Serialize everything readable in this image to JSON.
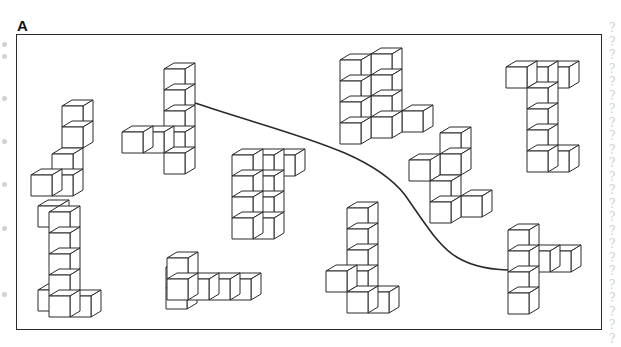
{
  "figure": {
    "panel_label": "A",
    "line_color": "#2a2a2a",
    "fill_color": "#ffffff",
    "cube_size": 21,
    "depth_dx": 10,
    "depth_dy": 6,
    "connector": {
      "from_shape": "shape-2",
      "to_shape": "shape-10",
      "path": "M195,103 C290,135 370,150 405,195 C440,245 450,268 508,270"
    },
    "shapes": [
      {
        "id": "shape-1",
        "origin": [
          31,
          112
        ],
        "cubes": [
          [
            1,
            3,
            0
          ],
          [
            1,
            2,
            0
          ],
          [
            0,
            3,
            0
          ],
          [
            1,
            1,
            1
          ],
          [
            1,
            0,
            1
          ]
        ]
      },
      {
        "id": "shape-2",
        "origin": [
          122,
          132
        ],
        "cubes": [
          [
            0,
            0,
            0
          ],
          [
            1,
            0,
            0
          ],
          [
            2,
            0,
            0
          ],
          [
            2,
            1,
            0
          ],
          [
            2,
            -1,
            0
          ],
          [
            2,
            -2,
            0
          ],
          [
            2,
            -3,
            0
          ]
        ]
      },
      {
        "id": "shape-3",
        "origin": [
          232,
          218
        ],
        "cubes": [
          [
            0,
            0,
            0
          ],
          [
            1,
            0,
            0
          ],
          [
            0,
            -1,
            0
          ],
          [
            1,
            -1,
            0
          ],
          [
            0,
            -2,
            0
          ],
          [
            1,
            -2,
            0
          ],
          [
            0,
            -3,
            0
          ],
          [
            1,
            -3,
            0
          ],
          [
            2,
            -3,
            0
          ]
        ]
      },
      {
        "id": "shape-4",
        "origin": [
          340,
          123
        ],
        "cubes": [
          [
            0,
            0,
            0
          ],
          [
            0,
            -1,
            0
          ],
          [
            0,
            -2,
            0
          ],
          [
            0,
            -3,
            0
          ],
          [
            1,
            0,
            1
          ],
          [
            1,
            -1,
            1
          ],
          [
            1,
            -2,
            1
          ],
          [
            1,
            -3,
            1
          ],
          [
            2,
            0,
            2
          ]
        ]
      },
      {
        "id": "shape-5",
        "origin": [
          409,
          160
        ],
        "cubes": [
          [
            0,
            0,
            0
          ],
          [
            1,
            0,
            1
          ],
          [
            1,
            -1,
            1
          ],
          [
            1,
            1,
            0
          ],
          [
            1,
            2,
            0
          ],
          [
            2,
            2,
            1
          ]
        ]
      },
      {
        "id": "shape-6",
        "origin": [
          506,
          67
        ],
        "cubes": [
          [
            0,
            0,
            0
          ],
          [
            1,
            0,
            0
          ],
          [
            2,
            0,
            0
          ],
          [
            1,
            1,
            0
          ],
          [
            1,
            2,
            0
          ],
          [
            1,
            3,
            0
          ],
          [
            1,
            4,
            0
          ],
          [
            2,
            4,
            0
          ]
        ]
      },
      {
        "id": "shape-7",
        "origin": [
          28,
          296
        ],
        "cubes": [
          [
            0,
            0,
            1
          ],
          [
            1,
            0,
            0
          ],
          [
            2,
            0,
            0
          ],
          [
            1,
            -1,
            0
          ],
          [
            1,
            -2,
            0
          ],
          [
            1,
            -3,
            0
          ],
          [
            0,
            -4,
            1
          ],
          [
            1,
            -4,
            0
          ]
        ]
      },
      {
        "id": "shape-8",
        "origin": [
          146,
          300
        ],
        "cubes": [
          [
            0,
            0,
            2
          ],
          [
            0,
            -1,
            2
          ],
          [
            1,
            -1,
            0
          ],
          [
            2,
            -1,
            0
          ],
          [
            3,
            -1,
            0
          ],
          [
            4,
            -1,
            0
          ],
          [
            1,
            -2,
            0
          ]
        ]
      },
      {
        "id": "shape-9",
        "origin": [
          326,
          292
        ],
        "cubes": [
          [
            0,
            -1,
            0
          ],
          [
            1,
            0,
            0
          ],
          [
            2,
            0,
            0
          ],
          [
            1,
            -1,
            0
          ],
          [
            1,
            -2,
            0
          ],
          [
            1,
            -3,
            0
          ],
          [
            1,
            -4,
            0
          ]
        ]
      },
      {
        "id": "shape-10",
        "origin": [
          508,
          293
        ],
        "cubes": [
          [
            0,
            0,
            0
          ],
          [
            0,
            -1,
            0
          ],
          [
            0,
            -2,
            0
          ],
          [
            0,
            -3,
            0
          ],
          [
            1,
            -2,
            0
          ],
          [
            2,
            -2,
            0
          ]
        ]
      }
    ]
  },
  "margins": {
    "left_dot_positions": [
      42,
      54,
      96,
      139,
      182,
      226,
      292
    ],
    "right_binding_glyph": "?",
    "right_binding_count": 24
  }
}
